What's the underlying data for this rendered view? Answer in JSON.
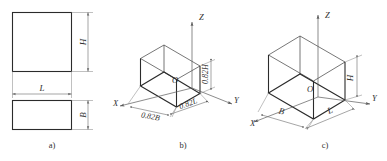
{
  "figure": {
    "captions": [
      {
        "id": "a",
        "text": "a)"
      },
      {
        "id": "b",
        "text": "b)"
      },
      {
        "id": "c",
        "text": "c)"
      }
    ],
    "panel_a": {
      "name": "orthographic-views",
      "front_view": {
        "width_label": "L",
        "height_label": "H"
      },
      "top_view": {
        "width_label": "L",
        "depth_label": "B"
      }
    },
    "panel_b": {
      "name": "isometric-projection-scaled",
      "axes": [
        {
          "id": "z",
          "label": "Z"
        },
        {
          "id": "y",
          "label": "Y"
        },
        {
          "id": "x",
          "label": "X"
        }
      ],
      "origin_label": "O",
      "dimensions": [
        {
          "id": "height",
          "label": "0.82H"
        },
        {
          "id": "length",
          "label": "0.82L"
        },
        {
          "id": "breadth",
          "label": "0.82B"
        }
      ]
    },
    "panel_c": {
      "name": "isometric-projection-full",
      "axes": [
        {
          "id": "z",
          "label": "Z"
        },
        {
          "id": "y",
          "label": "Y"
        },
        {
          "id": "x",
          "label": "X"
        }
      ],
      "origin_label": "O",
      "dimensions": [
        {
          "id": "height",
          "label": "H"
        },
        {
          "id": "length",
          "label": "L"
        },
        {
          "id": "breadth",
          "label": "B"
        }
      ]
    },
    "colors": {
      "edge": "#2b2b2b",
      "thin_edge": "#4a4a4a",
      "dimension": "#6a6a6a",
      "extension": "#8c8c8c",
      "text": "#2f2f2f",
      "background": "#ffffff"
    }
  }
}
